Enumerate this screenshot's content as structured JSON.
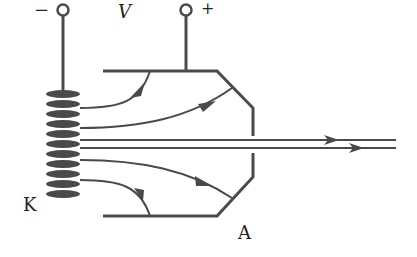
{
  "diagram": {
    "type": "cathode-ray electron emission schematic",
    "labels": {
      "negative_terminal": "−",
      "positive_terminal": "+",
      "voltage": "V",
      "cathode": "K",
      "anode": "A"
    },
    "colors": {
      "stroke": "#4a4a4a",
      "text": "#222222",
      "background": "#ffffff"
    },
    "electron_paths": 4,
    "beam_lines": 2
  }
}
